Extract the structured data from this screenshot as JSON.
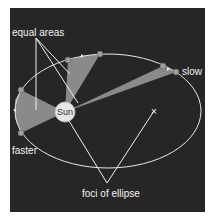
{
  "diagram": {
    "colors": {
      "background": "#262626",
      "orbit": "#e8e8e0",
      "sector_fill": "#8a8a8a",
      "pointer_lines": "#f0f0f0",
      "planet": "#a0a0a0",
      "sun": "#e6e6e6"
    },
    "labels": {
      "equal_areas": "equal areas",
      "slow": "slow",
      "faster": "faster",
      "sun": "Sun",
      "foci": "foci of ellipse",
      "focus_marker": "×"
    }
  }
}
